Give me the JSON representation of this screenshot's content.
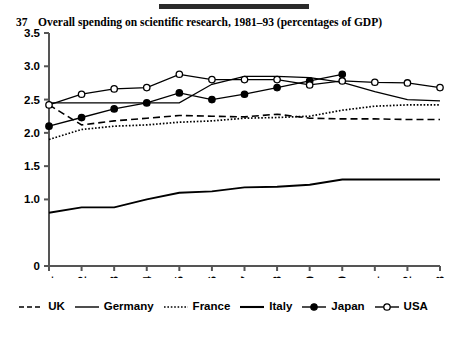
{
  "header": {
    "figure_number": "37",
    "title": "Overall spending on scientific research, 1981–93 (percentages of GDP)",
    "rule_color": "#2b2b2b"
  },
  "chart_data": {
    "type": "line",
    "title": "Overall spending on scientific research, 1981–93 (percentages of GDP)",
    "xlabel": "",
    "ylabel": "",
    "ylim": [
      0,
      3.5
    ],
    "yticks": [
      "0",
      "1.0",
      "1.5",
      "2.0",
      "2.5",
      "3.0",
      "3.5"
    ],
    "ytick_values": [
      0,
      1.0,
      1.5,
      2.0,
      2.5,
      3.0,
      3.5
    ],
    "grid": false,
    "legend_position": "bottom",
    "categories": [
      "1981",
      "1982",
      "1983",
      "1984",
      "1985",
      "1986",
      "1987",
      "1988",
      "1989",
      "1990",
      "1991",
      "1992",
      "1993"
    ],
    "x": [
      1981,
      1982,
      1983,
      1984,
      1985,
      1986,
      1987,
      1988,
      1989,
      1990,
      1991,
      1992,
      1993
    ],
    "series": [
      {
        "name": "UK",
        "style": "dashed",
        "marker": "none",
        "color": "#000000",
        "values": [
          2.42,
          2.12,
          2.18,
          2.22,
          2.26,
          2.25,
          2.24,
          2.28,
          2.22,
          2.21,
          2.21,
          2.2,
          2.2
        ]
      },
      {
        "name": "Germany",
        "style": "solid-thin",
        "marker": "none",
        "color": "#000000",
        "values": [
          2.45,
          2.45,
          2.45,
          2.45,
          2.45,
          2.73,
          2.85,
          2.85,
          2.83,
          2.76,
          2.62,
          2.5,
          2.48
        ]
      },
      {
        "name": "France",
        "style": "dotted",
        "marker": "none",
        "color": "#000000",
        "values": [
          1.9,
          2.05,
          2.1,
          2.12,
          2.16,
          2.18,
          2.22,
          2.23,
          2.25,
          2.34,
          2.4,
          2.42,
          2.42
        ]
      },
      {
        "name": "Italy",
        "style": "solid-thick",
        "marker": "none",
        "color": "#000000",
        "values": [
          0.8,
          0.88,
          0.88,
          1.0,
          1.1,
          1.12,
          1.18,
          1.19,
          1.22,
          1.3,
          1.3,
          1.3,
          1.3
        ]
      },
      {
        "name": "Japan",
        "style": "solid",
        "marker": "filled-circle",
        "color": "#000000",
        "values": [
          2.1,
          2.23,
          2.36,
          2.45,
          2.6,
          2.5,
          2.58,
          2.68,
          2.78,
          2.88,
          null,
          null,
          null
        ]
      },
      {
        "name": "USA",
        "style": "solid",
        "marker": "open-circle",
        "color": "#000000",
        "values": [
          2.42,
          2.58,
          2.66,
          2.68,
          2.88,
          2.8,
          2.8,
          2.8,
          2.72,
          2.78,
          2.76,
          2.75,
          2.68
        ]
      }
    ]
  },
  "legend": {
    "items": [
      {
        "label": "UK",
        "swatch": "dashed-line-swatch"
      },
      {
        "label": "Germany",
        "swatch": "solid-line-swatch"
      },
      {
        "label": "France",
        "swatch": "dotted-line-swatch"
      },
      {
        "label": "Italy",
        "swatch": "thick-line-swatch"
      },
      {
        "label": "Japan",
        "swatch": "filled-circle-line-swatch"
      },
      {
        "label": "USA",
        "swatch": "open-circle-line-swatch"
      }
    ]
  }
}
